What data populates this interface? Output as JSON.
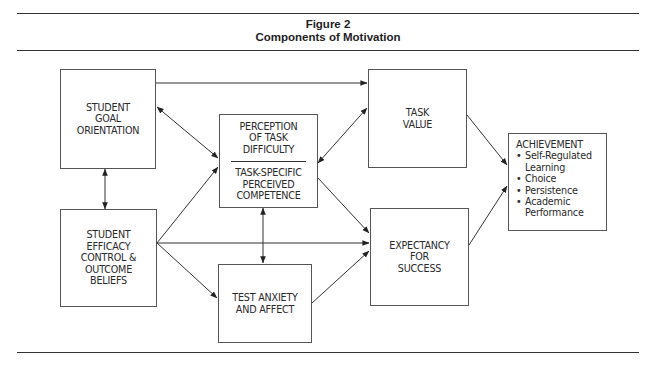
{
  "figure": {
    "label": "Figure 2",
    "title": "Components of Motivation"
  },
  "boxes": {
    "goal_orientation": {
      "lines": [
        "STUDENT",
        "GOAL",
        "ORIENTATION"
      ]
    },
    "efficacy_beliefs": {
      "lines": [
        "STUDENT",
        "EFFICACY",
        "CONTROL &",
        "OUTCOME",
        "BELIEFS"
      ]
    },
    "perception": {
      "top_lines": [
        "PERCEPTION",
        "OF TASK",
        "DIFFICULTY"
      ],
      "bottom_lines": [
        "TASK-SPECIFIC",
        "PERCEIVED",
        "COMPETENCE"
      ]
    },
    "test_anxiety": {
      "lines": [
        "TEST ANXIETY",
        "AND AFFECT"
      ]
    },
    "task_value": {
      "lines": [
        "TASK",
        "VALUE"
      ]
    },
    "expectancy": {
      "lines": [
        "EXPECTANCY",
        "FOR",
        "SUCCESS"
      ]
    },
    "achievement": {
      "title": "ACHIEVEMENT",
      "items": [
        "Self-Regulated Learning",
        "Choice",
        "Persistence",
        "Academic Performance"
      ],
      "item_lines": [
        [
          "Self-Regulated",
          "Learning"
        ],
        [
          "Choice"
        ],
        [
          "Persistence"
        ],
        [
          "Academic",
          "Performance"
        ]
      ]
    }
  },
  "edges": [
    {
      "from": "Student Goal Orientation",
      "to": "Task Value",
      "type": "one-way"
    },
    {
      "from": "Student Goal Orientation",
      "to": "Perception of Task Difficulty / Competence",
      "type": "two-way"
    },
    {
      "from": "Student Goal Orientation",
      "to": "Student Efficacy Control & Outcome Beliefs",
      "type": "two-way"
    },
    {
      "from": "Student Efficacy Control & Outcome Beliefs",
      "to": "Perception of Task Difficulty / Competence",
      "type": "one-way"
    },
    {
      "from": "Student Efficacy Control & Outcome Beliefs",
      "to": "Expectancy for Success",
      "type": "one-way"
    },
    {
      "from": "Student Efficacy Control & Outcome Beliefs",
      "to": "Test Anxiety and Affect",
      "type": "one-way"
    },
    {
      "from": "Perception of Task Difficulty / Competence",
      "to": "Task Value",
      "type": "two-way"
    },
    {
      "from": "Perception of Task Difficulty / Competence",
      "to": "Expectancy for Success",
      "type": "one-way"
    },
    {
      "from": "Perception of Task Difficulty / Competence",
      "to": "Test Anxiety and Affect",
      "type": "two-way"
    },
    {
      "from": "Test Anxiety and Affect",
      "to": "Expectancy for Success",
      "type": "one-way"
    },
    {
      "from": "Task Value",
      "to": "Achievement",
      "type": "one-way"
    },
    {
      "from": "Expectancy for Success",
      "to": "Achievement",
      "type": "one-way"
    }
  ]
}
